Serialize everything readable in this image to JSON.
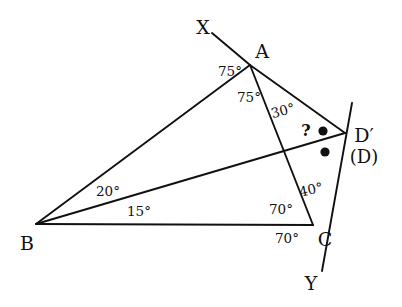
{
  "figure": {
    "type": "geometry-diagram",
    "background_color": "#ffffff",
    "stroke_color": "#111111",
    "points": {
      "A": {
        "x": 250,
        "y": 65
      },
      "B": {
        "x": 36,
        "y": 224
      },
      "C": {
        "x": 313,
        "y": 225
      },
      "D_prime": {
        "x": 345,
        "y": 133
      },
      "X_end": {
        "x": 212,
        "y": 33
      },
      "Y_end": {
        "x": 322,
        "y": 271
      },
      "ray_top_end": {
        "x": 352,
        "y": 103
      }
    },
    "segments": [
      {
        "name": "segment-XA",
        "from": "X_end",
        "to": "A"
      },
      {
        "name": "segment-AB",
        "from": "A",
        "to": "B"
      },
      {
        "name": "segment-AC",
        "from": "A",
        "to": "C"
      },
      {
        "name": "segment-AD",
        "from": "A",
        "to": "D_prime"
      },
      {
        "name": "segment-BC",
        "from": "B",
        "to": "C"
      },
      {
        "name": "segment-BD",
        "from": "B",
        "to": "D_prime"
      },
      {
        "name": "line-DY",
        "from": "ray_top_end",
        "to": "Y_end"
      }
    ],
    "vertex_labels": [
      {
        "name": "label-X",
        "text": "X",
        "x": 203,
        "y": 27
      },
      {
        "name": "label-A",
        "text": "A",
        "x": 262,
        "y": 51
      },
      {
        "name": "label-B",
        "text": "B",
        "x": 27,
        "y": 243
      },
      {
        "name": "label-C",
        "text": "C",
        "x": 325,
        "y": 239
      },
      {
        "name": "label-D-prime",
        "text": "D′",
        "x": 364,
        "y": 135
      },
      {
        "name": "label-D-paren",
        "text": "(D)",
        "x": 364,
        "y": 157
      },
      {
        "name": "label-Y",
        "text": "Y",
        "x": 311,
        "y": 283
      }
    ],
    "angle_labels": [
      {
        "name": "angle-XAB",
        "text": "75°",
        "x": 230,
        "y": 72
      },
      {
        "name": "angle-BAC",
        "text": "75°",
        "x": 249,
        "y": 98
      },
      {
        "name": "angle-CAD",
        "text": "30°",
        "x": 283,
        "y": 111
      },
      {
        "name": "angle-DCA",
        "text": "40°",
        "x": 311,
        "y": 190
      },
      {
        "name": "angle-ACB",
        "text": "70°",
        "x": 281,
        "y": 210
      },
      {
        "name": "angle-BCY",
        "text": "70°",
        "x": 287,
        "y": 239
      },
      {
        "name": "angle-ABD",
        "text": "20°",
        "x": 108,
        "y": 192
      },
      {
        "name": "angle-DBC",
        "text": "15°",
        "x": 139,
        "y": 212
      }
    ],
    "unknown_marker": {
      "name": "unknown-angle-question-mark",
      "text": "?",
      "x": 306,
      "y": 131
    },
    "equal_angle_dots": [
      {
        "name": "equal-angle-dot-upper",
        "x": 323,
        "y": 131,
        "r": 4.6
      },
      {
        "name": "equal-angle-dot-lower",
        "x": 325,
        "y": 152,
        "r": 4.6
      }
    ]
  }
}
